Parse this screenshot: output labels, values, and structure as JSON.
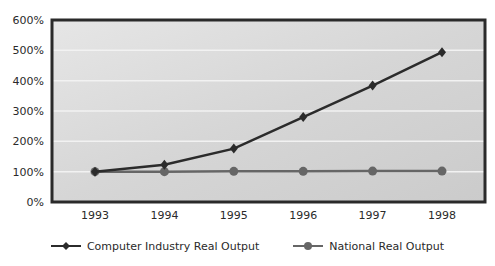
{
  "chart_data": {
    "type": "line",
    "title": "",
    "xlabel": "",
    "ylabel": "",
    "categories": [
      "1993",
      "1994",
      "1995",
      "1996",
      "1997",
      "1998"
    ],
    "series": [
      {
        "name": "Computer Industry Real Output",
        "values": [
          100,
          123,
          176,
          280,
          384,
          494
        ],
        "color": "#2b2b2b",
        "marker": "diamond"
      },
      {
        "name": "National Real Output",
        "values": [
          100,
          100,
          101,
          101,
          102,
          102
        ],
        "color": "#666666",
        "marker": "circle"
      }
    ],
    "ylim": [
      0,
      600
    ],
    "yticks": [
      0,
      100,
      200,
      300,
      400,
      500,
      600
    ],
    "ytick_labels": [
      "0%",
      "100%",
      "200%",
      "300%",
      "400%",
      "500%",
      "600%"
    ],
    "grid": true,
    "legend_position": "bottom"
  },
  "legend": {
    "items": [
      {
        "label": "Computer Industry Real Output",
        "marker": "diamond-icon"
      },
      {
        "label": "National Real Output",
        "marker": "circle-icon"
      }
    ]
  },
  "colors": {
    "plot_bg": "#d4d4d4",
    "frame": "#2a2a2a",
    "gridline": "#f2f2f2"
  }
}
